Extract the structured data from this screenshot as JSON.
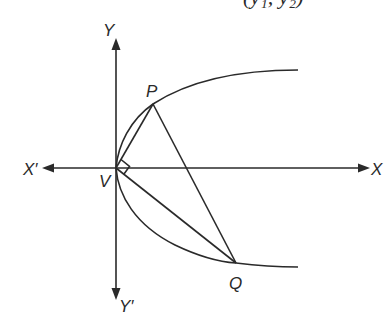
{
  "figure": {
    "top_fragment_text": "(y₁, y₂)",
    "labels": {
      "y_axis_positive": "Y",
      "y_axis_negative": "Y′",
      "x_axis_positive": "X",
      "x_axis_negative": "X′",
      "vertex": "V",
      "point_p": "P",
      "point_q": "Q"
    },
    "points": {
      "V": [
        116,
        168
      ],
      "P": [
        153,
        104
      ],
      "Q": [
        236,
        263
      ]
    },
    "colors": {
      "stroke": "#2a2a2a",
      "background": "#ffffff"
    }
  }
}
